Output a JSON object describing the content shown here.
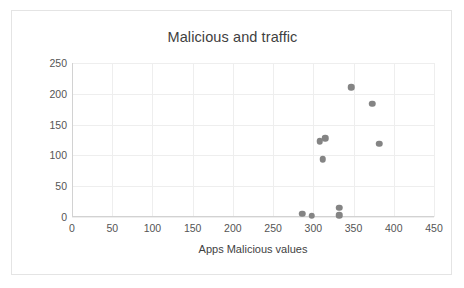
{
  "chart_data": {
    "type": "scatter",
    "title": "Malicious and traffic",
    "xlabel": "Apps Malicious values",
    "ylabel": "Volume of background traffic",
    "xlim": [
      0,
      450
    ],
    "ylim": [
      0,
      250
    ],
    "xticks": [
      0,
      50,
      100,
      150,
      200,
      250,
      300,
      350,
      400,
      450
    ],
    "yticks": [
      0,
      50,
      100,
      150,
      200,
      250
    ],
    "grid": true,
    "legend": null,
    "marker_color": "#848484",
    "series": [
      {
        "name": "Apps",
        "points": [
          [
            286,
            5
          ],
          [
            298,
            2
          ],
          [
            308,
            123
          ],
          [
            315,
            128
          ],
          [
            312,
            94
          ],
          [
            332,
            15
          ],
          [
            332,
            3
          ],
          [
            347,
            211
          ],
          [
            373,
            184
          ],
          [
            382,
            119
          ]
        ]
      }
    ]
  }
}
